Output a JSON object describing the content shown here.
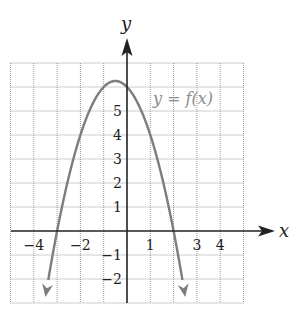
{
  "chart_data": {
    "type": "line",
    "title": "",
    "xlabel": "x",
    "ylabel": "y",
    "xlim": [
      -5,
      5
    ],
    "ylim": [
      -3,
      7
    ],
    "grid": true,
    "grid_style": "dotted",
    "x_tick_labels": [
      {
        "value": -4,
        "label": "−4"
      },
      {
        "value": -2,
        "label": "−2"
      },
      {
        "value": 1,
        "label": "1"
      },
      {
        "value": 3,
        "label": "3"
      },
      {
        "value": 4,
        "label": "4"
      }
    ],
    "y_tick_labels": [
      {
        "value": 5,
        "label": "5"
      },
      {
        "value": 4,
        "label": "4"
      },
      {
        "value": 3,
        "label": "3"
      },
      {
        "value": 2,
        "label": "2"
      },
      {
        "value": 1,
        "label": "1"
      },
      {
        "value": -1,
        "label": "−1"
      },
      {
        "value": -2,
        "label": "−2"
      }
    ],
    "series": [
      {
        "name": "y = f(x)",
        "label": "y = f(x)",
        "equation": "f(x) = -x^2 - x + 6",
        "color": "#7d7d7d",
        "arrows_at_ends": true,
        "x": [
          -3.5,
          -3,
          -2.5,
          -2,
          -1.5,
          -1,
          -0.5,
          0,
          0.5,
          1,
          1.5,
          2,
          2.5
        ],
        "y": [
          -2.75,
          0,
          2.25,
          4,
          5.25,
          6,
          6.25,
          6,
          5.25,
          4,
          2.25,
          0,
          -2.75
        ]
      }
    ],
    "key_points": {
      "vertex": [
        -0.5,
        6.25
      ],
      "y_intercept": [
        0,
        6
      ],
      "x_intercepts": [
        [
          -3,
          0
        ],
        [
          2,
          0
        ]
      ]
    },
    "annotations": [
      {
        "text": "y = f(x)",
        "x": 1.1,
        "y": 5.6,
        "color": "#8c8c8c"
      }
    ]
  }
}
